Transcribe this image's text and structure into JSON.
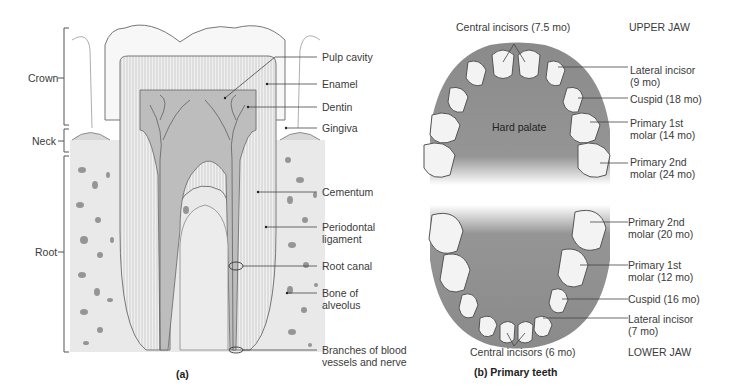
{
  "panel_a": {
    "caption": "(a)",
    "regions": [
      {
        "label": "Crown"
      },
      {
        "label": "Neck"
      },
      {
        "label": "Root"
      }
    ],
    "structures": [
      {
        "label": "Pulp cavity"
      },
      {
        "label": "Enamel"
      },
      {
        "label": "Dentin"
      },
      {
        "label": "Gingiva"
      },
      {
        "label": "Cementum"
      },
      {
        "label": "Periodontal",
        "label2": "ligament"
      },
      {
        "label": "Root canal"
      },
      {
        "label": "Bone of",
        "label2": "alveolus"
      },
      {
        "label": "Branches of blood",
        "label2": "vessels and nerve"
      }
    ]
  },
  "panel_b": {
    "caption": "(b) Primary teeth",
    "upper_jaw": {
      "title": "UPPER JAW",
      "center_label": "Hard palate",
      "teeth": [
        {
          "label": "Central incisors (7.5 mo)"
        },
        {
          "label": "Lateral incisor",
          "label2": "(9 mo)"
        },
        {
          "label": "Cuspid (18 mo)"
        },
        {
          "label": "Primary 1st",
          "label2": "molar (14 mo)"
        },
        {
          "label": "Primary 2nd",
          "label2": "molar (24 mo)"
        }
      ]
    },
    "lower_jaw": {
      "title": "LOWER JAW",
      "teeth": [
        {
          "label": "Primary 2nd",
          "label2": "molar (20 mo)"
        },
        {
          "label": "Primary 1st",
          "label2": "molar (12 mo)"
        },
        {
          "label": "Cuspid (16 mo)"
        },
        {
          "label": "Lateral incisor",
          "label2": "(7 mo)"
        },
        {
          "label": "Central incisors (6 mo)"
        }
      ]
    }
  },
  "colors": {
    "palate": "#8c8c8c",
    "tooth": "#f2f2f2",
    "line": "#555555",
    "bone": "#e6e6e6"
  }
}
